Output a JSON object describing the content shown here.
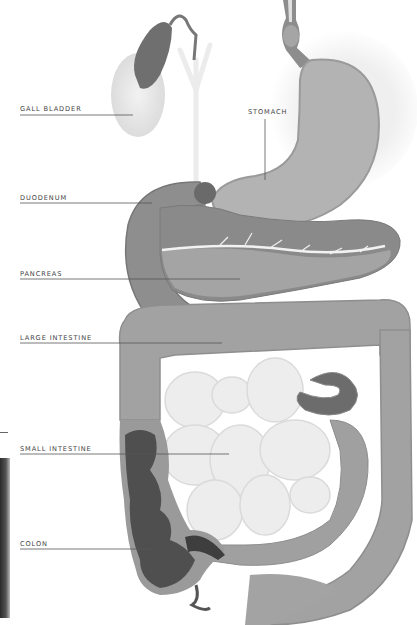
{
  "diagram": {
    "colors": {
      "organ_mid": "#9a9a9a",
      "organ_light": "#c9c9c9",
      "organ_dark": "#5a5a5a",
      "small_intestine": "#ececec",
      "label_text": "#444444",
      "leader_line": "#555555"
    },
    "labels": [
      {
        "id": "gall-bladder",
        "text": "GALL BLADDER",
        "x": 20,
        "y": 104,
        "line": {
          "x1": 20,
          "y1": 115,
          "x2": 133,
          "y2": 115
        }
      },
      {
        "id": "stomach",
        "text": "STOMACH",
        "x": 248,
        "y": 108,
        "line": {
          "x1": 265,
          "y1": 119,
          "x2": 265,
          "y2": 180
        }
      },
      {
        "id": "duodenum",
        "text": "DUODENUM",
        "x": 20,
        "y": 193,
        "line": {
          "x1": 20,
          "y1": 203,
          "x2": 152,
          "y2": 203
        }
      },
      {
        "id": "pancreas",
        "text": "PANCREAS",
        "x": 20,
        "y": 268,
        "line": {
          "x1": 20,
          "y1": 279,
          "x2": 240,
          "y2": 279
        }
      },
      {
        "id": "large-intestine",
        "text": "LARGE INTESTINE",
        "x": 20,
        "y": 335,
        "line": {
          "x1": 20,
          "y1": 343,
          "x2": 222,
          "y2": 343
        }
      },
      {
        "id": "small-intestine",
        "text": "SMALL INTESTINE",
        "x": 20,
        "y": 445,
        "line": {
          "x1": 20,
          "y1": 454,
          "x2": 229,
          "y2": 454
        }
      },
      {
        "id": "colon",
        "text": "COLON",
        "x": 20,
        "y": 540,
        "line": {
          "x1": 20,
          "y1": 549,
          "x2": 155,
          "y2": 549
        }
      }
    ]
  }
}
